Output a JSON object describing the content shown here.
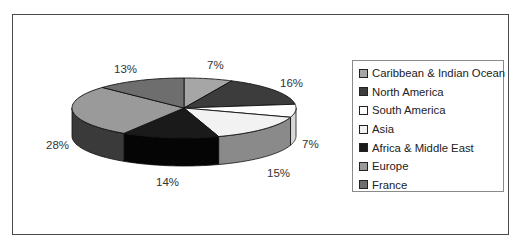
{
  "chart_data": {
    "type": "pie",
    "style": "3d-exploded-none",
    "title": "",
    "categories": [
      "Caribbean & Indian Ocean",
      "North America",
      "South America",
      "Asia",
      "Africa & Middle East",
      "Europe",
      "France"
    ],
    "values": [
      7,
      16,
      7,
      15,
      14,
      28,
      13
    ],
    "labels": [
      "7%",
      "16%",
      "7%",
      "15%",
      "14%",
      "28%",
      "13%"
    ],
    "colors": [
      "#a6a6a6",
      "#3c3c3c",
      "#ffffff",
      "#f2f2f2",
      "#1a1a1a",
      "#9a9a9a",
      "#6e6e6e"
    ],
    "legend_position": "right",
    "unit": "%"
  },
  "legend": {
    "items": [
      {
        "label": "Caribbean & Indian Ocean",
        "color": "#a6a6a6"
      },
      {
        "label": "North America",
        "color": "#3c3c3c"
      },
      {
        "label": "South America",
        "color": "#ffffff"
      },
      {
        "label": "Asia",
        "color": "#f2f2f2"
      },
      {
        "label": "Africa & Middle East",
        "color": "#1a1a1a"
      },
      {
        "label": "Europe",
        "color": "#9a9a9a"
      },
      {
        "label": "France",
        "color": "#6e6e6e"
      }
    ]
  },
  "slice_labels": [
    {
      "text": "7%",
      "x": 207,
      "y": 60
    },
    {
      "text": "16%",
      "x": 280,
      "y": 78
    },
    {
      "text": "7%",
      "x": 302,
      "y": 139
    },
    {
      "text": "15%",
      "x": 267,
      "y": 168
    },
    {
      "text": "14%",
      "x": 156,
      "y": 177
    },
    {
      "text": "28%",
      "x": 46,
      "y": 140
    },
    {
      "text": "13%",
      "x": 114,
      "y": 64
    }
  ]
}
